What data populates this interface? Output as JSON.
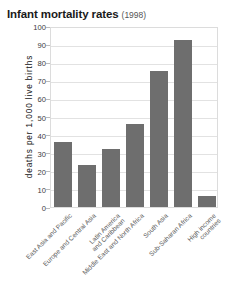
{
  "chart_data": {
    "type": "bar",
    "title": "Infant mortality rates",
    "subtitle": "(1998)",
    "xlabel": "",
    "ylabel": "deaths per 1,000 live births",
    "ylim": [
      0,
      100
    ],
    "yticks": [
      0,
      10,
      20,
      30,
      40,
      50,
      60,
      70,
      80,
      90,
      100
    ],
    "grid": true,
    "legend": null,
    "bar_color": "#6e6e6e",
    "categories": [
      "East Asia and Pacific",
      "Europe and Central Asia",
      "Latin America\nand Caribbean",
      "Middle East and North Africa",
      "South Asia",
      "Sub-Saharan Africa",
      "High income\ncountries"
    ],
    "values": [
      36,
      23,
      32,
      46,
      75,
      92,
      6
    ]
  }
}
